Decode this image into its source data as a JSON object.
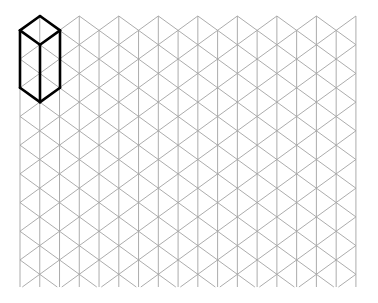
{
  "diagram": {
    "type": "isometric-grid",
    "background": "#ffffff",
    "grid": {
      "color": "#a3a3a3",
      "columns": 18,
      "x_start": 20,
      "x_spacing": 19.76,
      "y_top_odd": 16,
      "y_top_even": 30.35,
      "y_step": 28.7,
      "y_bottom": 287
    },
    "shape": {
      "name": "rectangular-prism",
      "color": "#000000",
      "description": "Isometric tall box drawn in top-left corner, 2 grid units wide and 2 units tall",
      "edges": [
        [
          [
            40,
            16
          ],
          [
            60,
            30.35
          ]
        ],
        [
          [
            60,
            30.35
          ],
          [
            40,
            44.7
          ]
        ],
        [
          [
            40,
            44.7
          ],
          [
            20,
            30.35
          ]
        ],
        [
          [
            20,
            30.35
          ],
          [
            40,
            16
          ]
        ],
        [
          [
            20,
            30.35
          ],
          [
            20,
            87.75
          ]
        ],
        [
          [
            60,
            30.35
          ],
          [
            60,
            87.75
          ]
        ],
        [
          [
            40,
            44.7
          ],
          [
            40,
            102.1
          ]
        ],
        [
          [
            20,
            87.75
          ],
          [
            40,
            102.1
          ]
        ],
        [
          [
            40,
            102.1
          ],
          [
            60,
            87.75
          ]
        ]
      ]
    }
  }
}
